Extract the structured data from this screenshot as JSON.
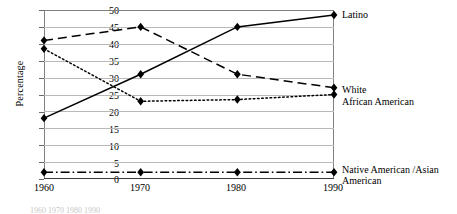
{
  "chart_data": {
    "type": "line",
    "title": "",
    "xlabel": "",
    "ylabel": "Percentage",
    "categories": [
      "1960",
      "1970",
      "1980",
      "1990"
    ],
    "x": [
      1960,
      1970,
      1980,
      1990
    ],
    "xlim": [
      1960,
      1990
    ],
    "ylim": [
      0,
      50
    ],
    "yticks": [
      0,
      5,
      10,
      15,
      20,
      25,
      30,
      35,
      40,
      45,
      50
    ],
    "grid": true,
    "legend_position": "right-inline",
    "marker": "diamond",
    "series": [
      {
        "name": "Latino",
        "values": [
          18,
          31,
          45,
          48.5
        ],
        "linestyle": "solid",
        "color": "#000000",
        "label_y_pct": 48.5
      },
      {
        "name": "White",
        "values": [
          41,
          45,
          31,
          27
        ],
        "linestyle": "dashed",
        "color": "#000000",
        "label_y_pct": 27
      },
      {
        "name": "African American",
        "values": [
          38.5,
          23,
          23.5,
          25
        ],
        "linestyle": "dotted",
        "color": "#000000",
        "label_y_pct": 25
      },
      {
        "name": "Native American /Asian\nAmerican",
        "values": [
          2,
          2,
          2,
          2
        ],
        "linestyle": "dashdot",
        "color": "#000000",
        "label_y_pct": 2
      }
    ]
  },
  "axis": {
    "y_label": "Percentage",
    "y_ticks": [
      "50",
      "45",
      "40",
      "35",
      "30",
      "25",
      "20",
      "15",
      "10",
      "5",
      "0"
    ],
    "x_ticks": [
      "1960",
      "1970",
      "1980",
      "1990"
    ]
  },
  "legend": {
    "latino": "Latino",
    "white": "White",
    "african_american": "African American",
    "native_asian": "Native American /Asian\nAmerican"
  },
  "caption": {
    "partial_text": "1960  1970  1980  1990"
  }
}
